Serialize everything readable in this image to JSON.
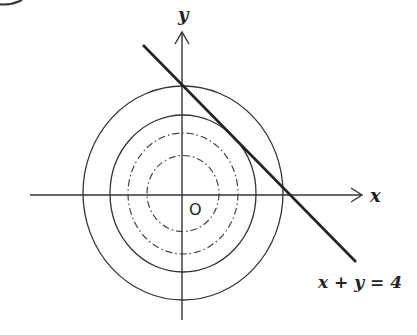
{
  "diagram": {
    "axis_x_label": "x",
    "axis_y_label": "y",
    "origin_label": "O",
    "line_label": "x + y = 4",
    "line_equation": "x + y = 4",
    "elements": [
      {
        "type": "circle",
        "style": "solid",
        "role": "outer"
      },
      {
        "type": "circle",
        "style": "solid",
        "role": "middle"
      },
      {
        "type": "circle",
        "style": "dash-dot",
        "role": "dashed-large"
      },
      {
        "type": "circle",
        "style": "dash-dot",
        "role": "dashed-small"
      },
      {
        "type": "line",
        "style": "solid-bold",
        "label": "x + y = 4"
      }
    ],
    "colors": {
      "stroke": "#333333",
      "background": "#ffffff"
    }
  }
}
